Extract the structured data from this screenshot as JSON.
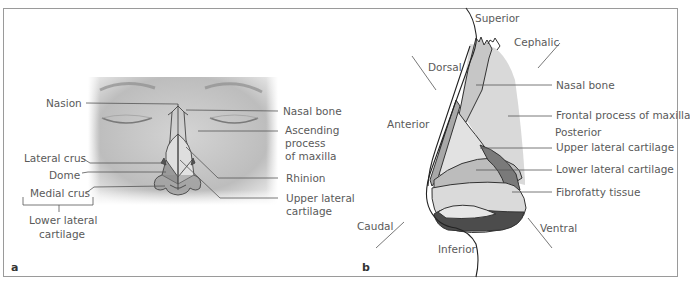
{
  "figure": {
    "panel_a": {
      "letter": "a",
      "view": "frontal",
      "labels": {
        "nasion": "Nasion",
        "nasal_bone": "Nasal bone",
        "ascending_process_l1": "Ascending",
        "ascending_process_l2": "process",
        "ascending_process_l3": "of maxilla",
        "lateral_crus": "Lateral crus",
        "dome": "Dome",
        "medial_crus": "Medial crus",
        "rhinion": "Rhinion",
        "upper_lateral_l1": "Upper lateral",
        "upper_lateral_l2": "cartilage",
        "lower_lateral_l1": "Lower lateral",
        "lower_lateral_l2": "cartilage"
      }
    },
    "panel_b": {
      "letter": "b",
      "view": "lateral",
      "directions": {
        "superior": "Superior",
        "cephalic": "Cephalic",
        "dorsal": "Dorsal",
        "anterior": "Anterior",
        "posterior": "Posterior",
        "caudal": "Caudal",
        "inferior": "Inferior",
        "ventral": "Ventral"
      },
      "labels": {
        "nasal_bone": "Nasal bone",
        "frontal_process": "Frontal process of maxilla",
        "upper_lateral": "Upper lateral cartilage",
        "lower_lateral": "Lower lateral cartilage",
        "fibrofatty": "Fibrofatty tissue"
      }
    },
    "colors": {
      "frame": "#9a9a9a",
      "label_text": "#5a5a5a",
      "leader_line": "#555555",
      "light_gray": "#d9d9d9",
      "mid_gray": "#b0b0b0",
      "dark_gray": "#6e6e6e",
      "darkest_gray": "#4a4a4a",
      "face_bg": "#c8c8c8"
    }
  }
}
